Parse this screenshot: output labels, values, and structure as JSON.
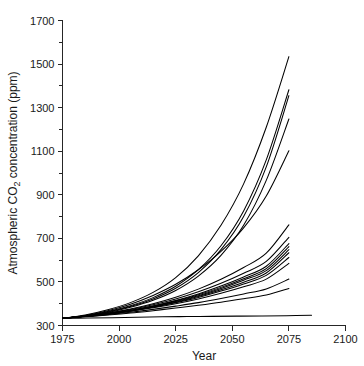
{
  "chart_data": {
    "type": "line",
    "title": "",
    "xlabel": "Year",
    "ylabel_parts": {
      "pre": "Atmospheric CO",
      "sub": "2",
      "post": " concentration (ppm)"
    },
    "ylabel": "Atmospheric CO2 concentration (ppm)",
    "xlim": [
      1975,
      2100
    ],
    "ylim": [
      300,
      1700
    ],
    "grid": false,
    "legend": null,
    "x_ticks_major": [
      1975,
      2000,
      2025,
      2050,
      2075,
      2100
    ],
    "x_ticklabels": [
      "1975",
      "2000",
      "2025",
      "2050",
      "2075",
      "2100"
    ],
    "y_ticks_major": [
      300,
      500,
      700,
      900,
      1100,
      1300,
      1500,
      1700
    ],
    "y_ticklabels": [
      "300",
      "500",
      "700",
      "900",
      "1100",
      "1300",
      "1500",
      "1700"
    ],
    "y_ticks_minor": [
      400,
      600,
      800,
      1000,
      1200,
      1400,
      1600
    ],
    "x": [
      1975,
      1985,
      1995,
      2005,
      2015,
      2025,
      2035,
      2045,
      2055,
      2065,
      2075
    ],
    "series": [
      {
        "name": "scenario-01",
        "values": [
          333,
          348,
          372,
          405,
          452,
          520,
          620,
          760,
          950,
          1210,
          1534
        ]
      },
      {
        "name": "scenario-02",
        "values": [
          333,
          345,
          364,
          391,
          428,
          480,
          556,
          666,
          826,
          1060,
          1382
        ]
      },
      {
        "name": "scenario-03",
        "values": [
          333,
          344,
          362,
          387,
          422,
          471,
          543,
          648,
          800,
          1028,
          1355
        ]
      },
      {
        "name": "scenario-04",
        "values": [
          333,
          344,
          360,
          384,
          416,
          461,
          527,
          622,
          760,
          966,
          1248
        ]
      },
      {
        "name": "scenario-05",
        "values": [
          333,
          346,
          368,
          398,
          438,
          489,
          556,
          640,
          748,
          894,
          1102
        ]
      },
      {
        "name": "scenario-06",
        "values": [
          333,
          343,
          357,
          376,
          400,
          430,
          467,
          512,
          566,
          632,
          762
        ]
      },
      {
        "name": "scenario-07",
        "values": [
          333,
          343,
          356,
          373,
          395,
          422,
          455,
          494,
          540,
          594,
          705
        ]
      },
      {
        "name": "scenario-08",
        "values": [
          333,
          342,
          354,
          370,
          390,
          415,
          445,
          481,
          523,
          572,
          676
        ]
      },
      {
        "name": "scenario-09",
        "values": [
          333,
          342,
          354,
          369,
          389,
          413,
          441,
          475,
          515,
          561,
          662
        ]
      },
      {
        "name": "scenario-10",
        "values": [
          333,
          342,
          353,
          368,
          387,
          410,
          437,
          470,
          508,
          552,
          648
        ]
      },
      {
        "name": "scenario-11",
        "values": [
          333,
          342,
          353,
          367,
          385,
          407,
          433,
          464,
          499,
          541,
          634
        ]
      },
      {
        "name": "scenario-12",
        "values": [
          333,
          342,
          353,
          367,
          384,
          405,
          429,
          458,
          491,
          530,
          612
        ]
      },
      {
        "name": "scenario-13",
        "values": [
          333,
          342,
          352,
          365,
          381,
          400,
          422,
          448,
          478,
          513,
          585
        ]
      },
      {
        "name": "scenario-14",
        "values": [
          333,
          341,
          350,
          361,
          374,
          389,
          405,
          424,
          445,
          468,
          513
        ]
      },
      {
        "name": "scenario-15",
        "values": [
          333,
          340,
          348,
          357,
          368,
          380,
          393,
          407,
          423,
          440,
          470
        ]
      },
      {
        "name": "scenario-16",
        "values": [
          333,
          334,
          336,
          338,
          340,
          341,
          342,
          343,
          344,
          345,
          347
        ]
      }
    ],
    "series_x_end": [
      2075,
      2075,
      2075,
      2075,
      2075,
      2075,
      2075,
      2075,
      2075,
      2075,
      2075,
      2075,
      2075,
      2075,
      2075,
      2085
    ],
    "n_series": 16
  }
}
